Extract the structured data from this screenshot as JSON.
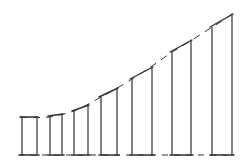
{
  "diagram": {
    "stroke_color": "#333333",
    "background": "#ffffff",
    "baseline_y": 155,
    "curve_points": [
      [
        20,
        117
      ],
      [
        50,
        117
      ],
      [
        74,
        111
      ],
      [
        101,
        97
      ],
      [
        132,
        79
      ],
      [
        172,
        52
      ],
      [
        212,
        27
      ],
      [
        232,
        14
      ]
    ],
    "bars": [
      {
        "x1": 22,
        "x2": 37,
        "top_left": 117,
        "top_right": 117
      },
      {
        "x1": 50,
        "x2": 62,
        "top_left": 116,
        "top_right": 114
      },
      {
        "x1": 74,
        "x2": 88,
        "top_left": 111,
        "top_right": 105
      },
      {
        "x1": 101,
        "x2": 117,
        "top_left": 97,
        "top_right": 88
      },
      {
        "x1": 132,
        "x2": 152,
        "top_left": 79,
        "top_right": 67
      },
      {
        "x1": 172,
        "x2": 191,
        "top_left": 52,
        "top_right": 40
      },
      {
        "x1": 212,
        "x2": 232,
        "top_left": 27,
        "top_right": 14
      }
    ]
  }
}
